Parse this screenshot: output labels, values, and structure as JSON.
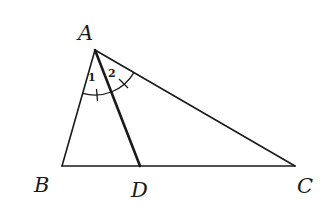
{
  "diagram": {
    "type": "triangle-angle-bisector",
    "vertices": {
      "A": {
        "label": "A",
        "x": 95,
        "y": 50
      },
      "B": {
        "label": "B",
        "x": 62,
        "y": 166
      },
      "C": {
        "label": "C",
        "x": 295,
        "y": 166
      },
      "D": {
        "label": "D",
        "x": 140,
        "y": 166
      }
    },
    "segments": [
      "AB",
      "AC",
      "BC",
      "AD"
    ],
    "angles": [
      {
        "label": "1",
        "between": [
          "AB",
          "AD"
        ]
      },
      {
        "label": "2",
        "between": [
          "AD",
          "AC"
        ]
      }
    ],
    "line_color": "#1a1a1a",
    "background": "#ffffff"
  }
}
